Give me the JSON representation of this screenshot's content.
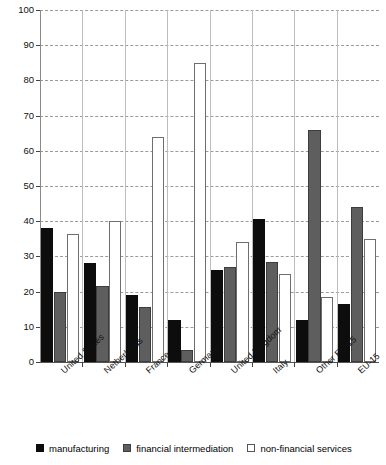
{
  "chart_data": {
    "type": "bar",
    "title": "",
    "subtitle": "",
    "xlabel": "",
    "ylabel": "",
    "ylim": [
      0,
      100
    ],
    "yticks": [
      0,
      10,
      20,
      30,
      40,
      50,
      60,
      70,
      80,
      90,
      100
    ],
    "grid": true,
    "legend_position": "bottom",
    "categories": [
      "United States",
      "Netherlands",
      "France",
      "Germany",
      "United Kingdom",
      "Italy",
      "Other EU-15",
      "EU-15"
    ],
    "series": [
      {
        "name": "manufacturing",
        "color": "#0d0d0d",
        "values": [
          38,
          28,
          19,
          12,
          26,
          40.5,
          12,
          16.5
        ]
      },
      {
        "name": "financial intermediation",
        "color": "#5e5e5e",
        "values": [
          20,
          21.5,
          15.5,
          3.5,
          27,
          28.5,
          66,
          44
        ]
      },
      {
        "name": "non-financial services",
        "color": "#ffffff",
        "values": [
          36.5,
          40,
          64,
          85,
          34,
          25,
          18.5,
          35
        ]
      }
    ]
  },
  "legend": {
    "items": [
      {
        "label": "manufacturing",
        "swatch": "manufacturing"
      },
      {
        "label": "financial intermediation",
        "swatch": "financial"
      },
      {
        "label": "non-financial services",
        "swatch": "nonfin"
      }
    ]
  }
}
